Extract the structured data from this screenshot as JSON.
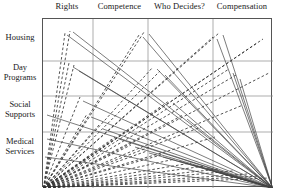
{
  "figure": {
    "title": "",
    "columns": [
      {
        "label": "Rights"
      },
      {
        "label": "Competence"
      },
      {
        "label": "Who Decides?"
      },
      {
        "label": "Compensation"
      }
    ],
    "rows": [
      {
        "label": "Housing"
      },
      {
        "label": "Day\nPrograms"
      },
      {
        "label": "Social\nSupports"
      },
      {
        "label": "Medical\nServices"
      }
    ],
    "row_labels_flat": [
      "Housing",
      "Day Programs",
      "Social Supports",
      "Medical Services"
    ],
    "colors": {
      "frame": "#555555",
      "gridline": "#8a8a8a",
      "line_solid": "#444444",
      "line_dashed": "#333333",
      "text": "#1a1a1a",
      "background": "#ffffff"
    }
  },
  "chart_data": {
    "type": "line",
    "title": "",
    "subtitle": "",
    "xlabel": "",
    "ylabel": "",
    "grid": true,
    "legend": null,
    "categories": [
      "Rights",
      "Competence",
      "Who Decides?",
      "Compensation"
    ],
    "row_categories": [
      "Housing",
      "Day Programs",
      "Social Supports",
      "Medical Services"
    ],
    "xlim": [
      0,
      230
    ],
    "ylim": [
      0,
      169
    ],
    "origins": [
      {
        "name": "left-origin",
        "x": 0.5,
        "y": 169
      },
      {
        "name": "right-origin",
        "x": 229.5,
        "y": 169
      }
    ],
    "series": [
      {
        "name": "left-fan",
        "origin": "left-origin",
        "style": "dashed",
        "endpoints": [
          {
            "x": 22,
            "y": 14
          },
          {
            "x": 27,
            "y": 12
          },
          {
            "x": 26,
            "y": 44
          },
          {
            "x": 31,
            "y": 46
          },
          {
            "x": 37,
            "y": 78
          },
          {
            "x": 44,
            "y": 95
          },
          {
            "x": 56,
            "y": 106
          },
          {
            "x": 72,
            "y": 118
          },
          {
            "x": 88,
            "y": 126
          },
          {
            "x": 104,
            "y": 132
          },
          {
            "x": 118,
            "y": 136
          },
          {
            "x": 132,
            "y": 140
          },
          {
            "x": 148,
            "y": 144
          },
          {
            "x": 162,
            "y": 147
          },
          {
            "x": 176,
            "y": 150
          },
          {
            "x": 190,
            "y": 152
          },
          {
            "x": 204,
            "y": 155
          },
          {
            "x": 216,
            "y": 157
          },
          {
            "x": 226,
            "y": 159
          },
          {
            "x": 96,
            "y": 16
          },
          {
            "x": 101,
            "y": 13
          },
          {
            "x": 110,
            "y": 48
          },
          {
            "x": 117,
            "y": 52
          },
          {
            "x": 126,
            "y": 82
          },
          {
            "x": 140,
            "y": 96
          },
          {
            "x": 158,
            "y": 108
          },
          {
            "x": 172,
            "y": 118
          },
          {
            "x": 170,
            "y": 18
          },
          {
            "x": 176,
            "y": 14
          },
          {
            "x": 186,
            "y": 50
          },
          {
            "x": 193,
            "y": 56
          },
          {
            "x": 200,
            "y": 86
          },
          {
            "x": 214,
            "y": 24
          },
          {
            "x": 220,
            "y": 20
          },
          {
            "x": 226,
            "y": 54
          }
        ]
      },
      {
        "name": "right-fan",
        "origin": "right-origin",
        "style": "solid",
        "endpoints": [
          {
            "x": 24,
            "y": 16
          },
          {
            "x": 30,
            "y": 13
          },
          {
            "x": 30,
            "y": 48
          },
          {
            "x": 36,
            "y": 52
          },
          {
            "x": 40,
            "y": 82
          },
          {
            "x": 48,
            "y": 98
          },
          {
            "x": 60,
            "y": 110
          },
          {
            "x": 76,
            "y": 120
          },
          {
            "x": 92,
            "y": 128
          },
          {
            "x": 106,
            "y": 134
          },
          {
            "x": 120,
            "y": 138
          },
          {
            "x": 136,
            "y": 142
          },
          {
            "x": 150,
            "y": 146
          },
          {
            "x": 164,
            "y": 149
          },
          {
            "x": 100,
            "y": 18
          },
          {
            "x": 106,
            "y": 15
          },
          {
            "x": 114,
            "y": 50
          },
          {
            "x": 122,
            "y": 56
          },
          {
            "x": 130,
            "y": 84
          },
          {
            "x": 144,
            "y": 100
          },
          {
            "x": 174,
            "y": 20
          },
          {
            "x": 180,
            "y": 16
          },
          {
            "x": 190,
            "y": 54
          },
          {
            "x": 197,
            "y": 60
          },
          {
            "x": 4,
            "y": 96
          },
          {
            "x": 4,
            "y": 120
          },
          {
            "x": 2,
            "y": 138
          }
        ]
      }
    ],
    "gridlines": {
      "vertical_x": [
        50,
        105,
        170
      ],
      "horizontal_y": [
        42,
        77,
        113
      ]
    }
  }
}
